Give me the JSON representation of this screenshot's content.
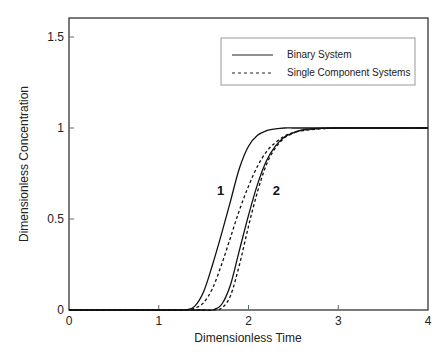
{
  "chart_data": {
    "type": "line",
    "title": "",
    "xlabel": "Dimensionless Time",
    "ylabel": "Dimensionless Concentration",
    "xlim": [
      0,
      4
    ],
    "ylim": [
      0,
      1.6
    ],
    "xticks": [
      0,
      1,
      2,
      3,
      4
    ],
    "xtick_labels": [
      "0",
      "1",
      "2",
      "3",
      "4"
    ],
    "yticks": [
      0,
      0.5,
      1,
      1.5
    ],
    "ytick_labels": [
      "0",
      "0.5",
      "1",
      "1.5"
    ],
    "grid": false,
    "legend_position": "upper right",
    "legend": [
      {
        "label": "Binary System",
        "style": "solid"
      },
      {
        "label": "Single Component Systems",
        "style": "dashed"
      }
    ],
    "annotations": [
      {
        "text": "1",
        "x": 1.65,
        "y": 0.63
      },
      {
        "text": "2",
        "x": 2.27,
        "y": 0.63
      }
    ],
    "x": [
      0,
      1.2,
      1.3,
      1.4,
      1.5,
      1.6,
      1.7,
      1.8,
      1.9,
      2.0,
      2.1,
      2.2,
      2.3,
      2.4,
      2.5,
      2.6,
      2.8,
      3.0,
      3.5,
      4.0
    ],
    "series": [
      {
        "name": "Binary System - component 1",
        "style": "solid",
        "values": [
          0,
          0,
          0.0,
          0.02,
          0.1,
          0.25,
          0.42,
          0.6,
          0.78,
          0.9,
          0.96,
          0.985,
          0.995,
          1.0,
          1.0,
          1.0,
          1.0,
          1.0,
          1.0,
          1.0
        ]
      },
      {
        "name": "Single Component - component 1",
        "style": "dashed",
        "values": [
          0,
          0,
          0.0,
          0.01,
          0.04,
          0.12,
          0.25,
          0.4,
          0.55,
          0.68,
          0.79,
          0.87,
          0.92,
          0.955,
          0.975,
          0.985,
          0.995,
          1.0,
          1.0,
          1.0
        ]
      },
      {
        "name": "Binary System - component 2",
        "style": "solid",
        "values": [
          0,
          0,
          0,
          0,
          0,
          0.0,
          0.03,
          0.14,
          0.33,
          0.52,
          0.69,
          0.82,
          0.9,
          0.95,
          0.975,
          0.99,
          0.998,
          1.0,
          1.0,
          1.0
        ]
      },
      {
        "name": "Single Component - component 2",
        "style": "dashed",
        "values": [
          0,
          0,
          0,
          0,
          0,
          0.0,
          0.01,
          0.08,
          0.25,
          0.46,
          0.65,
          0.8,
          0.89,
          0.945,
          0.972,
          0.988,
          0.997,
          1.0,
          1.0,
          1.0
        ]
      }
    ]
  }
}
